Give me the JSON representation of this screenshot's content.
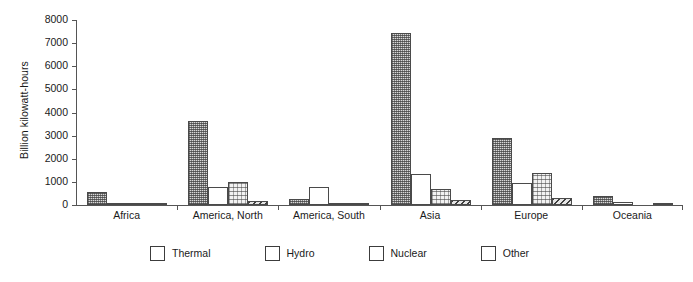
{
  "chart_data": {
    "type": "bar",
    "title": "",
    "xlabel": "",
    "ylabel": "Billion kilowatt-hours",
    "ylim": [
      0,
      8000
    ],
    "yticks": [
      0,
      1000,
      2000,
      3000,
      4000,
      5000,
      6000,
      7000,
      8000
    ],
    "ytick_labels": [
      "0",
      "1000",
      "2000",
      "3000",
      "4000",
      "5000",
      "6000",
      "7000",
      "8000"
    ],
    "grid": false,
    "legend_position": "bottom",
    "categories": [
      "Africa",
      "America, North",
      "America, South",
      "Asia",
      "Europe",
      "Oceania"
    ],
    "series": [
      {
        "name": "Thermal",
        "values": [
          550,
          3650,
          280,
          7450,
          2880,
          380
        ]
      },
      {
        "name": "Hydro",
        "values": [
          75,
          780,
          780,
          1330,
          950,
          120
        ]
      },
      {
        "name": "Nuclear",
        "values": [
          12,
          1000,
          12,
          700,
          1370,
          0
        ]
      },
      {
        "name": "Other",
        "values": [
          8,
          160,
          45,
          200,
          290,
          20
        ]
      }
    ]
  },
  "legend": {
    "items": [
      {
        "label": "Thermal",
        "pattern": "dense-dot-crosshatch"
      },
      {
        "label": "Hydro",
        "pattern": "solid-white"
      },
      {
        "label": "Nuclear",
        "pattern": "light-dot"
      },
      {
        "label": "Other",
        "pattern": "diagonal-hatch"
      }
    ]
  }
}
